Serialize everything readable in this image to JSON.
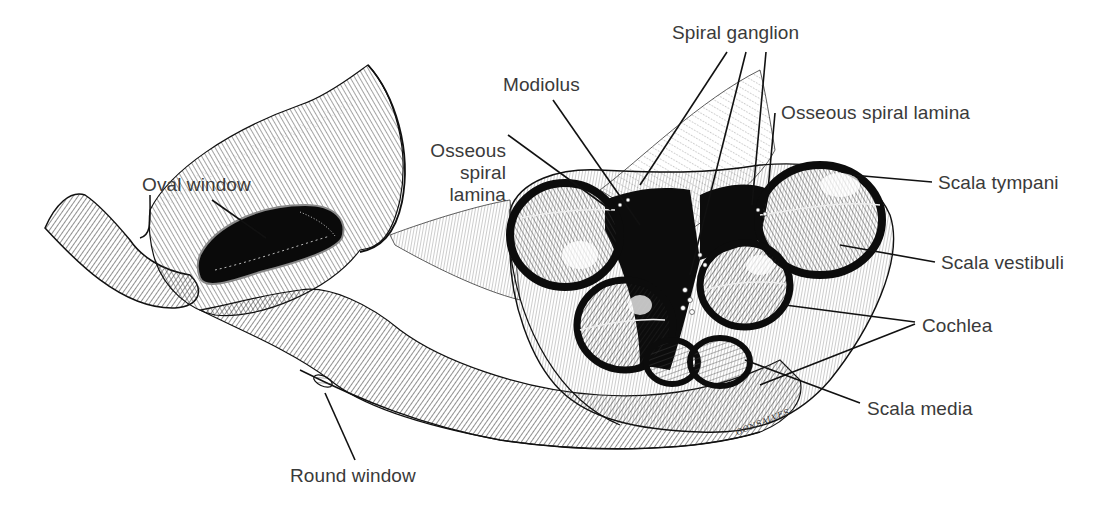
{
  "figure": {
    "style": "pen-and-ink hatched anatomical illustration",
    "colors": {
      "background": "#ffffff",
      "ink": "#111111",
      "label_text": "#3a3a3a"
    }
  },
  "labels": {
    "spiral_ganglion": "Spiral ganglion",
    "modiolus": "Modiolus",
    "osseous_spiral_lamina_left": "Osseous\nspiral\nlamina",
    "osseous_spiral_lamina_right": "Osseous spiral lamina",
    "scala_tympani": "Scala tympani",
    "scala_vestibuli": "Scala vestibuli",
    "cochlea": "Cochlea",
    "scala_media": "Scala media",
    "oval_window": "Oval window",
    "round_window": "Round window"
  },
  "signature": "GONSALVES"
}
